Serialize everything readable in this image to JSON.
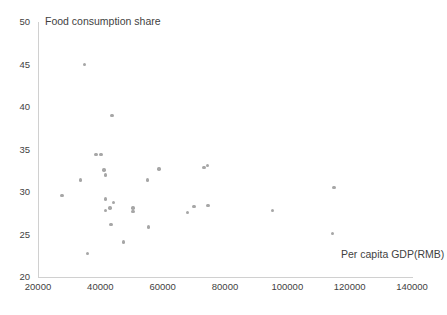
{
  "chart_data": {
    "type": "scatter",
    "title": "",
    "xlabel": "Per capita GDP(RMB)",
    "ylabel": "Food consumption share",
    "xlim": [
      20000,
      140000
    ],
    "ylim": [
      20,
      50
    ],
    "xticks": [
      20000,
      40000,
      60000,
      80000,
      100000,
      120000,
      140000
    ],
    "yticks": [
      20,
      25,
      30,
      35,
      40,
      45,
      50
    ],
    "xtick_labels": [
      "20000",
      "40000",
      "60000",
      "80000",
      "100000",
      "120000",
      "140000"
    ],
    "ytick_labels": [
      "20",
      "25",
      "30",
      "35",
      "40",
      "45",
      "50"
    ],
    "grid": false,
    "legend": null,
    "marker_color": "#a6a6a6",
    "axis_color": "#d0d0d0",
    "series": [
      {
        "name": "Provinces",
        "points": [
          {
            "x": 35000,
            "y": 45.0
          },
          {
            "x": 43700,
            "y": 39.0
          },
          {
            "x": 38600,
            "y": 34.4
          },
          {
            "x": 40200,
            "y": 34.4
          },
          {
            "x": 41200,
            "y": 32.6
          },
          {
            "x": 41700,
            "y": 32.0
          },
          {
            "x": 58800,
            "y": 32.7
          },
          {
            "x": 73300,
            "y": 32.9
          },
          {
            "x": 74300,
            "y": 33.1
          },
          {
            "x": 33600,
            "y": 31.4
          },
          {
            "x": 55100,
            "y": 31.4
          },
          {
            "x": 115000,
            "y": 30.5
          },
          {
            "x": 27700,
            "y": 29.6
          },
          {
            "x": 41700,
            "y": 29.2
          },
          {
            "x": 44200,
            "y": 28.8
          },
          {
            "x": 74600,
            "y": 28.4
          },
          {
            "x": 70000,
            "y": 28.3
          },
          {
            "x": 50500,
            "y": 28.1
          },
          {
            "x": 43100,
            "y": 28.1
          },
          {
            "x": 41700,
            "y": 27.8
          },
          {
            "x": 50500,
            "y": 27.7
          },
          {
            "x": 67900,
            "y": 27.6
          },
          {
            "x": 95300,
            "y": 27.8
          },
          {
            "x": 43400,
            "y": 26.2
          },
          {
            "x": 55400,
            "y": 25.9
          },
          {
            "x": 114500,
            "y": 25.1
          },
          {
            "x": 47500,
            "y": 24.1
          },
          {
            "x": 35900,
            "y": 22.8
          }
        ]
      }
    ]
  }
}
